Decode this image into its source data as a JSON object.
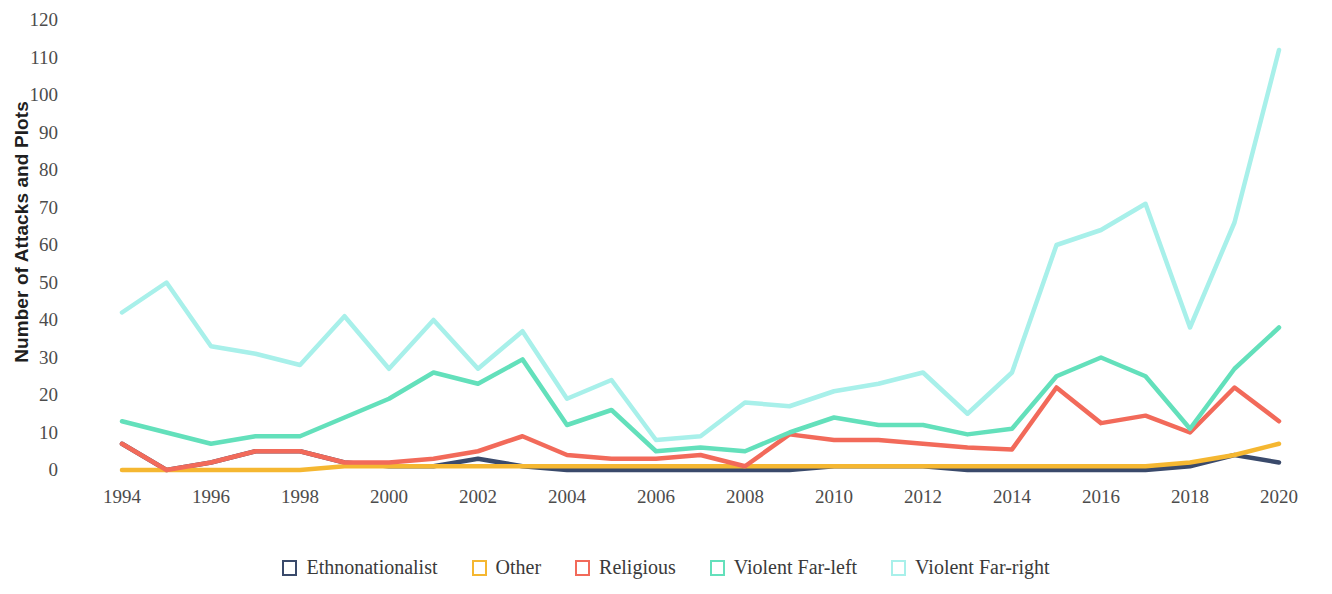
{
  "chart_data": {
    "type": "line",
    "title": "",
    "xlabel": "",
    "ylabel": "Number of Attacks and Plots",
    "x": [
      1994,
      1995,
      1996,
      1997,
      1998,
      1999,
      2000,
      2001,
      2002,
      2003,
      2004,
      2005,
      2006,
      2007,
      2008,
      2009,
      2010,
      2011,
      2012,
      2013,
      2014,
      2015,
      2016,
      2017,
      2018,
      2019,
      2020
    ],
    "xlim": [
      1994,
      2020
    ],
    "ylim": [
      0,
      120
    ],
    "yticks": [
      0,
      10,
      20,
      30,
      40,
      50,
      60,
      70,
      80,
      90,
      100,
      110,
      120
    ],
    "xticks": [
      1994,
      1996,
      1998,
      2000,
      2002,
      2004,
      2006,
      2008,
      2010,
      2012,
      2014,
      2016,
      2018,
      2020
    ],
    "grid": false,
    "legend_position": "bottom",
    "series": [
      {
        "name": "Ethnonationalist",
        "color": "#3a4a6b",
        "values": [
          7,
          0,
          2,
          5,
          5,
          2,
          1,
          1,
          3,
          1,
          0,
          0,
          0,
          0,
          0,
          0,
          1,
          1,
          1,
          0,
          0,
          0,
          0,
          0,
          1,
          4,
          2
        ]
      },
      {
        "name": "Other",
        "color": "#f5b731",
        "values": [
          0,
          0,
          0,
          0,
          0,
          1,
          1,
          1,
          1,
          1,
          1,
          1,
          1,
          1,
          1,
          1,
          1,
          1,
          1,
          1,
          1,
          1,
          1,
          1,
          2,
          4,
          7
        ]
      },
      {
        "name": "Religious",
        "color": "#f26a5a",
        "values": [
          7,
          0,
          2,
          5,
          5,
          2,
          2,
          3,
          5,
          9,
          4,
          3,
          3,
          4,
          1,
          9.5,
          8,
          8,
          7,
          6,
          5.5,
          22,
          12.5,
          14.5,
          10,
          22,
          13
        ]
      },
      {
        "name": "Violent Far-left",
        "color": "#63e0bb",
        "values": [
          13,
          10,
          7,
          9,
          9,
          14,
          19,
          26,
          23,
          29.5,
          12,
          16,
          5,
          6,
          5,
          10,
          14,
          12,
          12,
          9.5,
          11,
          25,
          30,
          25,
          11,
          27,
          38
        ]
      },
      {
        "name": "Violent Far-right",
        "color": "#a8f0ea",
        "values": [
          42,
          50,
          33,
          31,
          28,
          41,
          27,
          40,
          27,
          37,
          19,
          24,
          8,
          9,
          18,
          17,
          21,
          23,
          26,
          15,
          26,
          60,
          64,
          71,
          38,
          66,
          112
        ]
      }
    ]
  },
  "legend": {
    "items": [
      {
        "label": "Ethnonationalist",
        "color": "#3a4a6b"
      },
      {
        "label": "Other",
        "color": "#f5b731"
      },
      {
        "label": "Religious",
        "color": "#f26a5a"
      },
      {
        "label": "Violent Far-left",
        "color": "#63e0bb"
      },
      {
        "label": "Violent Far-right",
        "color": "#a8f0ea"
      }
    ]
  }
}
